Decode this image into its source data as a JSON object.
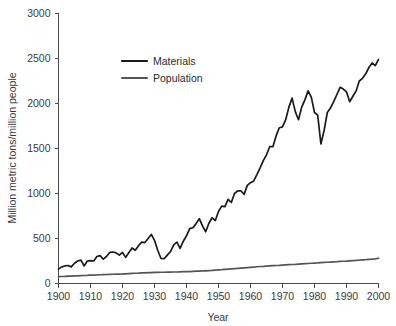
{
  "figure": {
    "background": "#ffffff",
    "axis_color": "#4a4a4a",
    "text_color": "#3a3a3a"
  },
  "chart_data": {
    "type": "line",
    "title": "",
    "xlabel": "Year",
    "ylabel": "Million metric tons/million people",
    "xlim": [
      1900,
      2000
    ],
    "ylim": [
      0,
      3000
    ],
    "xticks": [
      1900,
      1910,
      1920,
      1930,
      1940,
      1950,
      1960,
      1970,
      1980,
      1990,
      2000
    ],
    "xtick_labels": [
      "1900",
      "1910",
      "1920",
      "1930",
      "1940",
      "1950",
      "1960",
      "1970",
      "1980",
      "1990",
      "2000"
    ],
    "yticks": [
      0,
      500,
      1000,
      1500,
      2000,
      2500,
      3000
    ],
    "ytick_labels": [
      "0",
      "500",
      "1000",
      "1500",
      "2000",
      "2500",
      "3000"
    ],
    "grid": false,
    "legend_position": "upper-left-inside",
    "x": [
      1900,
      1901,
      1902,
      1903,
      1904,
      1905,
      1906,
      1907,
      1908,
      1909,
      1910,
      1911,
      1912,
      1913,
      1914,
      1915,
      1916,
      1917,
      1918,
      1919,
      1920,
      1921,
      1922,
      1923,
      1924,
      1925,
      1926,
      1927,
      1928,
      1929,
      1930,
      1931,
      1932,
      1933,
      1934,
      1935,
      1936,
      1937,
      1938,
      1939,
      1940,
      1941,
      1942,
      1943,
      1944,
      1945,
      1946,
      1947,
      1948,
      1949,
      1950,
      1951,
      1952,
      1953,
      1954,
      1955,
      1956,
      1957,
      1958,
      1959,
      1960,
      1961,
      1962,
      1963,
      1964,
      1965,
      1966,
      1967,
      1968,
      1969,
      1970,
      1971,
      1972,
      1973,
      1974,
      1975,
      1976,
      1977,
      1978,
      1979,
      1980,
      1981,
      1982,
      1983,
      1984,
      1985,
      1986,
      1987,
      1988,
      1989,
      1990,
      1991,
      1992,
      1993,
      1994,
      1995,
      1996,
      1997,
      1998,
      1999,
      2000
    ],
    "series": [
      {
        "name": "Materials",
        "color": "#1a1a1a",
        "width": 1.7,
        "values": [
          160,
          185,
          195,
          200,
          185,
          225,
          250,
          260,
          195,
          250,
          255,
          250,
          300,
          310,
          270,
          300,
          345,
          350,
          340,
          315,
          345,
          290,
          345,
          395,
          370,
          420,
          460,
          455,
          500,
          545,
          480,
          370,
          280,
          275,
          315,
          355,
          430,
          460,
          390,
          470,
          530,
          610,
          620,
          665,
          720,
          640,
          575,
          670,
          730,
          700,
          800,
          860,
          855,
          935,
          900,
          1000,
          1030,
          1030,
          990,
          1090,
          1120,
          1140,
          1210,
          1285,
          1365,
          1430,
          1520,
          1520,
          1640,
          1730,
          1740,
          1820,
          1960,
          2060,
          1910,
          1820,
          1960,
          2040,
          2140,
          2070,
          1900,
          1870,
          1550,
          1700,
          1900,
          1950,
          2020,
          2100,
          2180,
          2160,
          2130,
          2020,
          2080,
          2140,
          2250,
          2280,
          2330,
          2400,
          2450,
          2420,
          2490
        ]
      },
      {
        "name": "Population",
        "color": "#555555",
        "width": 1.7,
        "values": [
          76,
          78,
          79,
          81,
          82,
          84,
          85,
          87,
          89,
          90,
          92,
          94,
          95,
          97,
          99,
          100,
          102,
          103,
          104,
          105,
          106,
          108,
          110,
          112,
          114,
          115,
          117,
          119,
          120,
          121,
          123,
          124,
          125,
          125,
          126,
          127,
          128,
          128,
          130,
          131,
          132,
          133,
          135,
          137,
          138,
          140,
          141,
          144,
          146,
          149,
          152,
          154,
          157,
          160,
          163,
          166,
          168,
          171,
          174,
          177,
          180,
          183,
          186,
          189,
          191,
          194,
          196,
          198,
          200,
          202,
          205,
          207,
          209,
          211,
          213,
          216,
          218,
          220,
          222,
          225,
          227,
          229,
          232,
          234,
          236,
          238,
          240,
          242,
          245,
          247,
          249,
          252,
          255,
          258,
          260,
          263,
          265,
          268,
          270,
          273,
          281
        ]
      }
    ]
  },
  "legend": {
    "items": [
      {
        "label": "Materials"
      },
      {
        "label": "Population"
      }
    ]
  }
}
